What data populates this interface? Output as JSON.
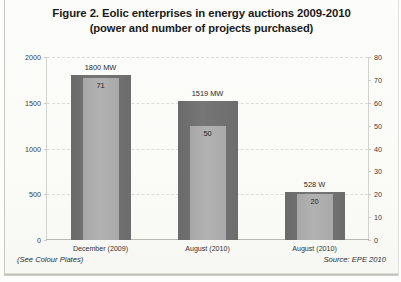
{
  "figure": {
    "title_line1": "Figure 2. Eolic enterprises in energy auctions 2009-2010",
    "title_line2": "(power and number of projects purchased)",
    "footer_left": "(See Colour Plates)",
    "footer_right": "Source: EPE 2010"
  },
  "colors": {
    "bar_power": "#6e6e6e",
    "bar_count": "#ababab",
    "grid": "#dcdcd8",
    "axis": "#d2d2ce",
    "text": "#1f1f1f",
    "page_background": "#fdfdfb"
  },
  "chart_data": {
    "type": "bar",
    "title": "Figure 2. Eolic enterprises in energy auctions 2009-2010 (power and number of projects purchased)",
    "xlabel": "",
    "ylabel": "",
    "categories": [
      "December (2009)",
      "August (2010)",
      "August (2010)"
    ],
    "series": [
      {
        "name": "Power",
        "axis": "left",
        "unit": "MW",
        "values": [
          1800,
          1519,
          528
        ],
        "data_labels": [
          "1800 MW",
          "1519 MW",
          "528 W"
        ]
      },
      {
        "name": "Number of projects",
        "axis": "right",
        "unit": "projects",
        "values": [
          71,
          50,
          20
        ],
        "data_labels": [
          "71",
          "50",
          "20"
        ]
      }
    ],
    "ylim": [
      0,
      2000
    ],
    "yticks": [
      0,
      500,
      1000,
      1500,
      2000
    ],
    "ylim_right": [
      0,
      80
    ],
    "yticks_right": [
      0,
      10,
      20,
      30,
      40,
      50,
      60,
      70,
      80
    ],
    "grid": true,
    "legend": false
  }
}
